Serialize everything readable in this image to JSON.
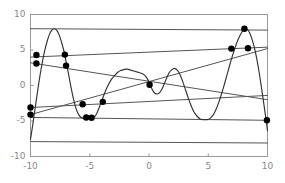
{
  "figure": {
    "background_color": "#ffffff",
    "frame_color": "#999999",
    "curve_color": "#333333",
    "line_color": "#555555",
    "marker_color": "#000000",
    "tick_label_color": "#888888"
  },
  "axes": {
    "x_ticks": [
      "-10",
      "-5",
      "0",
      "5",
      "10"
    ],
    "x_tick_values": [
      -10,
      -5,
      0,
      5,
      10
    ],
    "y_ticks": [
      "10",
      "5",
      "0",
      "-5",
      "-10"
    ],
    "y_tick_values": [
      10,
      5,
      0,
      -5,
      -10
    ],
    "xlim": [
      -10,
      10
    ],
    "ylim": [
      -10,
      10
    ],
    "xlabel": "",
    "ylabel": "",
    "grid": false
  },
  "chart_data": {
    "type": "line",
    "title": "",
    "xlabel": "",
    "ylabel": "",
    "xlim": [
      -10,
      10
    ],
    "ylim": [
      -10,
      10
    ],
    "grid": false,
    "legend": "none",
    "x_ticks": [
      -10,
      -5,
      0,
      5,
      10
    ],
    "y_ticks": [
      -10,
      -5,
      0,
      5,
      10
    ],
    "series": [
      {
        "name": "oscillating-curve",
        "type": "line",
        "points": [
          [
            -10.0,
            -7.6
          ],
          [
            -9.8,
            -5.4
          ],
          [
            -9.6,
            -3.1
          ],
          [
            -9.4,
            -0.8
          ],
          [
            -9.2,
            1.4
          ],
          [
            -9.0,
            3.3
          ],
          [
            -8.8,
            4.9
          ],
          [
            -8.6,
            6.2
          ],
          [
            -8.4,
            7.2
          ],
          [
            -8.2,
            7.8
          ],
          [
            -8.0,
            8.0
          ],
          [
            -7.8,
            7.8
          ],
          [
            -7.6,
            7.2
          ],
          [
            -7.4,
            6.2
          ],
          [
            -7.2,
            5.0
          ],
          [
            -7.0,
            3.4
          ],
          [
            -6.8,
            1.7
          ],
          [
            -6.6,
            -0.1
          ],
          [
            -6.4,
            -1.7
          ],
          [
            -6.2,
            -3.0
          ],
          [
            -6.0,
            -3.9
          ],
          [
            -5.8,
            -4.4
          ],
          [
            -5.6,
            -4.6
          ],
          [
            -5.4,
            -4.5
          ],
          [
            -5.2,
            -4.4
          ],
          [
            -5.0,
            -4.5
          ],
          [
            -4.8,
            -4.6
          ],
          [
            -4.6,
            -4.4
          ],
          [
            -4.4,
            -3.9
          ],
          [
            -4.2,
            -3.1
          ],
          [
            -4.0,
            -2.2
          ],
          [
            -3.8,
            -1.3
          ],
          [
            -3.6,
            -0.5
          ],
          [
            -3.4,
            0.2
          ],
          [
            -3.2,
            0.8
          ],
          [
            -3.0,
            1.2
          ],
          [
            -2.8,
            1.6
          ],
          [
            -2.6,
            1.9
          ],
          [
            -2.4,
            2.1
          ],
          [
            -2.2,
            2.2
          ],
          [
            -2.0,
            2.3
          ],
          [
            -1.8,
            2.3
          ],
          [
            -1.6,
            2.2
          ],
          [
            -1.4,
            2.1
          ],
          [
            -1.2,
            2.0
          ],
          [
            -1.0,
            1.9
          ],
          [
            -0.8,
            1.8
          ],
          [
            -0.6,
            1.7
          ],
          [
            -0.4,
            1.5
          ],
          [
            -0.2,
            1.1
          ],
          [
            0.0,
            0.5
          ],
          [
            0.1,
            0.1
          ],
          [
            0.2,
            -0.3
          ],
          [
            0.35,
            -0.8
          ],
          [
            0.5,
            -1.1
          ],
          [
            0.7,
            -1.2
          ],
          [
            0.9,
            -1.0
          ],
          [
            1.1,
            -0.5
          ],
          [
            1.3,
            0.3
          ],
          [
            1.5,
            1.1
          ],
          [
            1.7,
            1.8
          ],
          [
            1.9,
            2.2
          ],
          [
            2.1,
            2.4
          ],
          [
            2.3,
            2.3
          ],
          [
            2.5,
            1.9
          ],
          [
            2.7,
            1.2
          ],
          [
            2.9,
            0.3
          ],
          [
            3.1,
            -0.7
          ],
          [
            3.3,
            -1.7
          ],
          [
            3.5,
            -2.6
          ],
          [
            3.7,
            -3.4
          ],
          [
            3.9,
            -4.0
          ],
          [
            4.1,
            -4.4
          ],
          [
            4.3,
            -4.7
          ],
          [
            4.5,
            -4.8
          ],
          [
            4.7,
            -4.8
          ],
          [
            4.9,
            -4.8
          ],
          [
            5.1,
            -4.7
          ],
          [
            5.3,
            -4.4
          ],
          [
            5.5,
            -3.9
          ],
          [
            5.7,
            -3.2
          ],
          [
            5.9,
            -2.3
          ],
          [
            6.1,
            -1.3
          ],
          [
            6.3,
            -0.2
          ],
          [
            6.5,
            1.0
          ],
          [
            6.7,
            2.2
          ],
          [
            6.9,
            3.4
          ],
          [
            7.1,
            4.5
          ],
          [
            7.3,
            5.5
          ],
          [
            7.5,
            6.4
          ],
          [
            7.7,
            7.1
          ],
          [
            7.9,
            7.7
          ],
          [
            8.1,
            8.0
          ],
          [
            8.3,
            7.9
          ],
          [
            8.5,
            7.4
          ],
          [
            8.7,
            6.5
          ],
          [
            8.9,
            5.3
          ],
          [
            9.1,
            3.7
          ],
          [
            9.3,
            1.8
          ],
          [
            9.5,
            -0.4
          ],
          [
            9.7,
            -2.7
          ],
          [
            9.9,
            -5.1
          ],
          [
            10.0,
            -6.4
          ]
        ]
      },
      {
        "name": "upper-slope-line",
        "type": "line",
        "points": [
          [
            -10,
            4.0
          ],
          [
            10,
            5.4
          ]
        ]
      },
      {
        "name": "lower-slope-line",
        "type": "line",
        "points": [
          [
            -10,
            -3.1
          ],
          [
            10,
            -1.4
          ]
        ]
      },
      {
        "name": "rising-line",
        "type": "line",
        "points": [
          [
            -10,
            -4.1
          ],
          [
            10,
            5.2
          ]
        ]
      },
      {
        "name": "descending-line",
        "type": "line",
        "points": [
          [
            -10,
            3.2
          ],
          [
            10,
            -2.0
          ]
        ]
      },
      {
        "name": "shallow-line",
        "type": "line",
        "points": [
          [
            -10,
            -4.5
          ],
          [
            10,
            -4.9
          ]
        ]
      },
      {
        "name": "top-horizontal-line",
        "type": "line",
        "points": [
          [
            -10,
            8.0
          ],
          [
            10,
            7.8
          ]
        ]
      },
      {
        "name": "bottom-horizontal-line",
        "type": "line",
        "points": [
          [
            -10,
            -7.9
          ],
          [
            10,
            -8.1
          ]
        ]
      }
    ],
    "markers": {
      "name": "intersection-points",
      "shape": "circle",
      "size": 3.2,
      "points": [
        [
          -10.0,
          -4.1
        ],
        [
          -10.0,
          -3.1
        ],
        [
          -9.5,
          4.3
        ],
        [
          -9.5,
          3.1
        ],
        [
          -7.1,
          4.35
        ],
        [
          -7.0,
          2.8
        ],
        [
          -5.6,
          -2.65
        ],
        [
          -5.3,
          -4.5
        ],
        [
          -4.85,
          -4.55
        ],
        [
          -3.9,
          -2.3
        ],
        [
          0.05,
          0.1
        ],
        [
          6.95,
          5.2
        ],
        [
          8.05,
          8.0
        ],
        [
          8.35,
          5.25
        ],
        [
          9.95,
          -4.9
        ]
      ]
    }
  }
}
